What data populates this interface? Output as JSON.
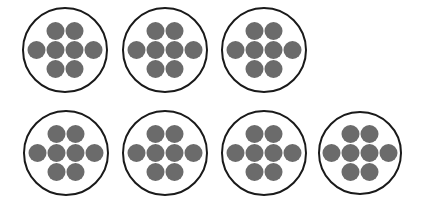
{
  "diagram": {
    "counters_per_group": 8,
    "group_count": 7,
    "colors": {
      "outline": "#1a1a1a",
      "counter": "#6b6b6b",
      "background": "#ffffff"
    },
    "groups": [
      {
        "cx": 65,
        "cy": 50,
        "r": 42
      },
      {
        "cx": 165,
        "cy": 50,
        "r": 42
      },
      {
        "cx": 264,
        "cy": 50,
        "r": 42
      },
      {
        "cx": 66,
        "cy": 153,
        "r": 42
      },
      {
        "cx": 165,
        "cy": 153,
        "r": 42
      },
      {
        "cx": 264,
        "cy": 153,
        "r": 42
      },
      {
        "cx": 360,
        "cy": 153,
        "r": 41
      }
    ],
    "counter_offsets": [
      [
        -9.5,
        -19
      ],
      [
        9.5,
        -19
      ],
      [
        -28.5,
        0
      ],
      [
        -9.5,
        0
      ],
      [
        9.5,
        0
      ],
      [
        28.5,
        0
      ],
      [
        -9.5,
        19
      ],
      [
        9.5,
        19
      ]
    ],
    "counter_radius": 9
  }
}
